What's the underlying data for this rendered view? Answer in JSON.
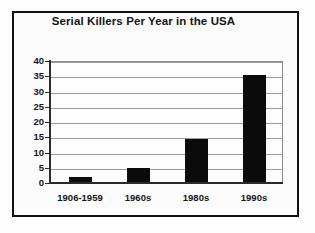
{
  "chart_data": {
    "type": "bar",
    "title": "Serial Killers Per Year in the USA",
    "xlabel": "",
    "ylabel": "",
    "categories": [
      "1906-1959",
      "1960s",
      "1980s",
      "1990s"
    ],
    "values": [
      2,
      5,
      14.5,
      35.5
    ],
    "ylim": [
      0,
      40
    ],
    "yticks": [
      0,
      5,
      10,
      15,
      20,
      25,
      30,
      35,
      40
    ],
    "ytick_labels": [
      "0",
      "5",
      "10",
      "15",
      "20",
      "25",
      "30",
      "35",
      "40"
    ],
    "grid": true,
    "legend": false,
    "bar_color": "#0b0b0b",
    "gridline_color": "#9a9a9a",
    "axis_color": "#2b2b2b",
    "background_color": "#fdfdfd",
    "frame_color": "#111111"
  }
}
